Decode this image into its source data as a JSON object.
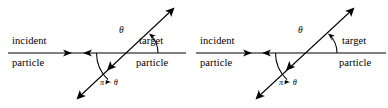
{
  "figure": {
    "type": "physics-scattering-diagram",
    "background_color": "#ffffff",
    "line_color": "#000000",
    "panel_count": 2
  },
  "panels": [
    {
      "id": "left",
      "labels": {
        "incident_top": "incident",
        "incident_bottom": "particle",
        "target_top": "target",
        "target_bottom": "particle",
        "angle_theta": "θ",
        "angle_supplement": "π − θ"
      },
      "geometry": {
        "vertex_x": 133,
        "vertex_y": 53,
        "theta_degrees": 47,
        "axis_left_x": 8,
        "axis_right_x": 186,
        "scatter_arrow_tip_x": 172,
        "scatter_arrow_tip_y": 10,
        "back_arrow_tip_x": 79,
        "back_arrow_tip_y": 97
      }
    },
    {
      "id": "right",
      "labels": {
        "incident_top": "incident",
        "incident_bottom": "particle",
        "target_top": "target",
        "target_bottom": "particle",
        "angle_theta": "θ",
        "angle_supplement": "π − θ"
      },
      "geometry": {
        "vertex_x": 118,
        "vertex_y": 53,
        "theta_degrees": 47,
        "axis_left_x": 2,
        "axis_right_x": 192,
        "scatter_arrow_tip_x": 158,
        "scatter_arrow_tip_y": 10,
        "back_arrow_tip_x": 64,
        "back_arrow_tip_y": 97
      }
    }
  ]
}
